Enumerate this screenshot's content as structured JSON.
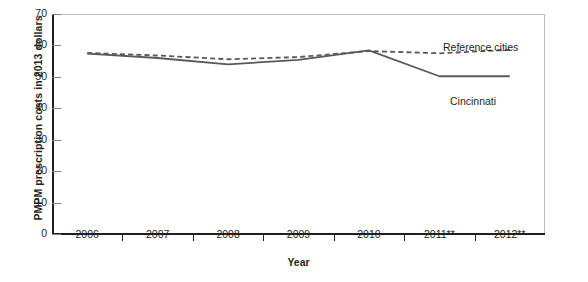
{
  "chart_data": {
    "type": "line",
    "title": "",
    "xlabel": "Year",
    "ylabel": "PMPM prescription costs in 2013 dollars",
    "categories": [
      "2006",
      "2007",
      "2008",
      "2009",
      "2010",
      "2011**",
      "2012**"
    ],
    "x": [
      2006,
      2007,
      2008,
      2009,
      2010,
      2011,
      2012
    ],
    "ylim": [
      0,
      70
    ],
    "yticks": [
      0,
      10,
      20,
      30,
      40,
      50,
      60,
      70
    ],
    "ytick_labels": [
      "0",
      "10",
      "20",
      "30",
      "40",
      "50",
      "60",
      "70"
    ],
    "grid": false,
    "legend_position": "inline-annotation",
    "series": [
      {
        "name": "Reference cities",
        "style": "dashed",
        "color": "#58595b",
        "values": [
          57.6,
          56.8,
          55.6,
          56.3,
          58.2,
          57.5,
          58.6
        ]
      },
      {
        "name": "Cincinnati",
        "style": "solid",
        "color": "#58595b",
        "values": [
          57.4,
          56.0,
          54.0,
          55.4,
          58.4,
          50.2,
          50.2
        ]
      }
    ],
    "annotations": [
      {
        "text": "Reference cities",
        "series": "Reference cities"
      },
      {
        "text": "Cincinnati",
        "series": "Cincinnati"
      }
    ]
  },
  "axes": {
    "y_title": "PMPM prescription costs in 2013 dollars",
    "x_title": "Year"
  },
  "colors": {
    "axis": "#231f20",
    "frame": "#bcbec0",
    "series": "#58595b",
    "background": "#ffffff"
  }
}
